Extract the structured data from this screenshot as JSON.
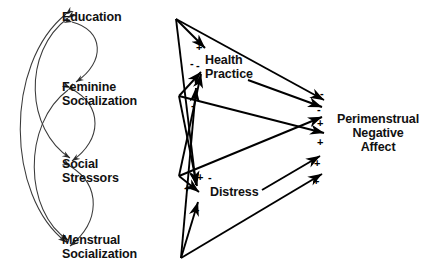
{
  "figure": {
    "type": "path-diagram",
    "background_color": "#ffffff",
    "line_color": "#000000",
    "text_color": "#111111"
  },
  "nodes": [
    {
      "id": "education",
      "label": "Education",
      "align": "left",
      "x": 62,
      "y": 10,
      "role": "exogenous"
    },
    {
      "id": "feminine_socialization",
      "label_line1": "Feminine",
      "label_line2": "Socialization",
      "align": "left",
      "x": 62,
      "y": 80,
      "role": "exogenous"
    },
    {
      "id": "social_stressors",
      "label_line1": "Social",
      "label_line2": "Stressors",
      "align": "left",
      "x": 62,
      "y": 157,
      "role": "exogenous"
    },
    {
      "id": "menstrual_socialization",
      "label_line1": "Menstrual",
      "label_line2": "Socialization",
      "align": "left",
      "x": 62,
      "y": 233,
      "role": "exogenous"
    },
    {
      "id": "health_practice",
      "label_line1": "Health",
      "label_line2": "Practice",
      "align": "left",
      "x": 205,
      "y": 53,
      "role": "mediator"
    },
    {
      "id": "distress",
      "label": "Distress",
      "align": "left",
      "x": 210,
      "y": 192,
      "role": "mediator"
    },
    {
      "id": "perimenstrual_negative_affect",
      "label_line1": "Perimenstrual",
      "label_line2": "Negative",
      "label_line3": "Affect",
      "align": "centered",
      "x": 337,
      "y": 112,
      "role": "outcome"
    }
  ],
  "sign_labels": [
    {
      "id": "sign-edu-hp",
      "text": "+",
      "x": 196,
      "y": 42
    },
    {
      "id": "sign-edu-distress",
      "text": "-",
      "x": 190,
      "y": 58
    },
    {
      "id": "sign-fem-hp",
      "text": "-",
      "x": 196,
      "y": 86
    },
    {
      "id": "sign-soc-hp",
      "text": "-",
      "x": 193,
      "y": 102
    },
    {
      "id": "sign-distress-in-a",
      "text": "+",
      "x": 197,
      "y": 176
    },
    {
      "id": "sign-distress-in-b",
      "text": "-",
      "x": 209,
      "y": 176
    },
    {
      "id": "sign-distress-in-c",
      "text": "+",
      "x": 186,
      "y": 186
    },
    {
      "id": "sign-mens-distress",
      "text": "+",
      "x": 194,
      "y": 208
    },
    {
      "id": "sign-out-1",
      "text": "-",
      "x": 320,
      "y": 92
    },
    {
      "id": "sign-out-2",
      "text": "-",
      "x": 318,
      "y": 110
    },
    {
      "id": "sign-out-3",
      "text": "+",
      "x": 318,
      "y": 124
    },
    {
      "id": "sign-out-4",
      "text": "+",
      "x": 318,
      "y": 142
    },
    {
      "id": "sign-out-5",
      "text": "+",
      "x": 315,
      "y": 162
    },
    {
      "id": "sign-out-6",
      "text": "+",
      "x": 314,
      "y": 180
    }
  ],
  "correlations": [
    {
      "id": "corr-edu-feminine",
      "from": "Education",
      "to": "Feminine Socialization",
      "double_headed": true
    },
    {
      "id": "corr-edu-social",
      "from": "Education",
      "to": "Social Stressors",
      "double_headed": true
    },
    {
      "id": "corr-edu-menstrual",
      "from": "Education",
      "to": "Menstrual Socialization",
      "double_headed": true
    },
    {
      "id": "corr-feminine-social",
      "from": "Feminine Socialization",
      "to": "Social Stressors",
      "double_headed": true
    },
    {
      "id": "corr-feminine-menstrual",
      "from": "Feminine Socialization",
      "to": "Menstrual Socialization",
      "double_headed": true
    },
    {
      "id": "corr-social-menstrual",
      "from": "Social Stressors",
      "to": "Menstrual Socialization",
      "double_headed": true
    }
  ],
  "paths": [
    {
      "id": "path-edu-hp",
      "from": "Education",
      "to": "Health Practice",
      "sign": "+"
    },
    {
      "id": "path-edu-distress",
      "from": "Education",
      "to": "Distress",
      "sign": "-"
    },
    {
      "id": "path-edu-pna",
      "from": "Education",
      "to": "Perimenstrual Negative Affect",
      "sign": "-"
    },
    {
      "id": "path-fem-hp",
      "from": "Feminine Socialization",
      "to": "Health Practice",
      "sign": "-"
    },
    {
      "id": "path-fem-distress",
      "from": "Feminine Socialization",
      "to": "Distress",
      "sign": "+"
    },
    {
      "id": "path-fem-pna",
      "from": "Feminine Socialization",
      "to": "Perimenstrual Negative Affect",
      "sign": "+"
    },
    {
      "id": "path-soc-hp",
      "from": "Social Stressors",
      "to": "Health Practice",
      "sign": "-"
    },
    {
      "id": "path-soc-distress",
      "from": "Social Stressors",
      "to": "Distress",
      "sign": "+"
    },
    {
      "id": "path-soc-pna",
      "from": "Social Stressors",
      "to": "Perimenstrual Negative Affect",
      "sign": "+"
    },
    {
      "id": "path-mens-hp",
      "from": "Menstrual Socialization",
      "to": "Health Practice",
      "sign": "-"
    },
    {
      "id": "path-mens-distress",
      "from": "Menstrual Socialization",
      "to": "Distress",
      "sign": "+"
    },
    {
      "id": "path-mens-pna",
      "from": "Menstrual Socialization",
      "to": "Perimenstrual Negative Affect",
      "sign": "+"
    },
    {
      "id": "path-hp-pna",
      "from": "Health Practice",
      "to": "Perimenstrual Negative Affect",
      "sign": "-"
    },
    {
      "id": "path-distress-pna",
      "from": "Distress",
      "to": "Perimenstrual Negative Affect",
      "sign": "+"
    }
  ]
}
